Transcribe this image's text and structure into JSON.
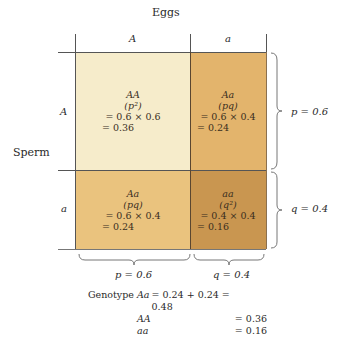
{
  "diagram": {
    "title": "Eggs",
    "row_axis_label": "Sperm",
    "columns": [
      {
        "allele": "A",
        "freq_label": "p = 0.6"
      },
      {
        "allele": "a",
        "freq_label": "q = 0.4"
      }
    ],
    "rows": [
      {
        "allele": "A",
        "freq_label": "p = 0.6"
      },
      {
        "allele": "a",
        "freq_label": "q = 0.4"
      }
    ],
    "cells": [
      {
        "genotype": "AA",
        "formula": "(p²)",
        "product": "= 0.6 × 0.6",
        "result": "= 0.36",
        "color": "#f6eccb"
      },
      {
        "genotype": "Aa",
        "formula": "(pq)",
        "product": "= 0.6 × 0.4",
        "result": "= 0.24",
        "color": "#e3b46c"
      },
      {
        "genotype": "Aa",
        "formula": "(pq)",
        "product": "= 0.6 × 0.4",
        "result": "= 0.24",
        "color": "#eac37e"
      },
      {
        "genotype": "aa",
        "formula": "(q²)",
        "product": "= 0.4 × 0.4",
        "result": "= 0.16",
        "color": "#c99650"
      }
    ],
    "summary": {
      "label": "Genotype",
      "rows": [
        {
          "name": "Aa",
          "value": "= 0.24 + 0.24 = 0.48"
        },
        {
          "name": "AA",
          "value": "= 0.36"
        },
        {
          "name": "aa",
          "value": "= 0.16"
        }
      ]
    },
    "colors": {
      "line": "#555555",
      "brace": "#777777",
      "AA": "#f6eccb",
      "Aa_top": "#e3b46c",
      "Aa_bottom": "#eac37e",
      "aa": "#c99650"
    }
  }
}
